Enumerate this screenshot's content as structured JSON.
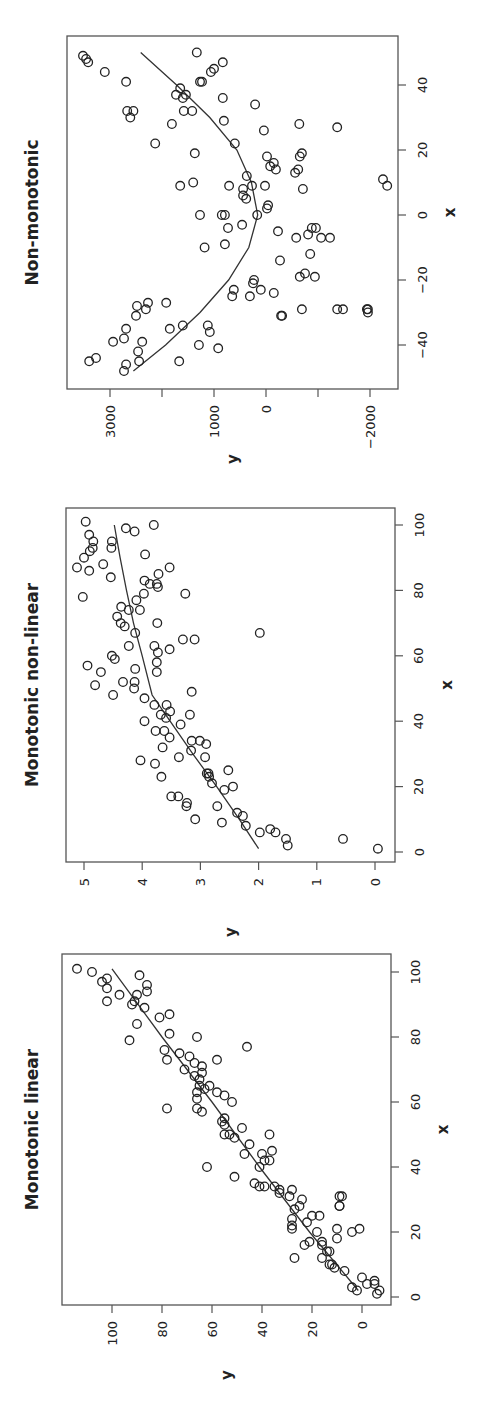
{
  "figure": {
    "orientation": "rotated-90-ccw",
    "panel_count": 3
  },
  "chart_data": [
    {
      "type": "scatter",
      "title": "Non-monotonic",
      "xlabel": "x",
      "ylabel": "y",
      "xlim": [
        -50,
        50
      ],
      "ylim": [
        -2600,
        3700
      ],
      "xticks": [
        -40,
        -20,
        0,
        20,
        40
      ],
      "yticks": [
        -2000,
        -1000,
        0,
        1000,
        2000,
        3000
      ],
      "ytick_labels": [
        "-2000",
        "",
        "0",
        "1000",
        "",
        "3000"
      ],
      "grid": false,
      "layout": {
        "box": [
          67,
          36,
          398,
          389
        ],
        "x_zero_screen": 215,
        "x_px_per_unit": 3.25,
        "y_zero_screen": 266,
        "y_px_per_unit": 0.052
      },
      "points": [
        [
          49,
          3520
        ],
        [
          47,
          3420
        ],
        [
          48,
          3460
        ],
        [
          41,
          2690
        ],
        [
          44,
          3100
        ],
        [
          32,
          2670
        ],
        [
          32,
          2550
        ],
        [
          30,
          2610
        ],
        [
          28,
          1810
        ],
        [
          22,
          2130
        ],
        [
          9,
          1650
        ],
        [
          50,
          1330
        ],
        [
          47,
          830
        ],
        [
          44,
          1060
        ],
        [
          45,
          1000
        ],
        [
          41,
          1270
        ],
        [
          37,
          1540
        ],
        [
          32,
          1580
        ],
        [
          36,
          830
        ],
        [
          29,
          810
        ],
        [
          32,
          1420
        ],
        [
          19,
          1370
        ],
        [
          10,
          1400
        ],
        [
          36,
          1600
        ],
        [
          37,
          1730
        ],
        [
          41,
          1230
        ],
        [
          39,
          1650
        ],
        [
          22,
          600
        ],
        [
          34,
          210
        ],
        [
          26,
          40
        ],
        [
          9,
          270
        ],
        [
          18,
          -20
        ],
        [
          9,
          20
        ],
        [
          16,
          -150
        ],
        [
          3,
          -40
        ],
        [
          2,
          -20
        ],
        [
          12,
          370
        ],
        [
          6,
          440
        ],
        [
          8,
          440
        ],
        [
          -4,
          730
        ],
        [
          -3,
          460
        ],
        [
          5,
          380
        ],
        [
          9,
          710
        ],
        [
          0,
          850
        ],
        [
          -10,
          1180
        ],
        [
          -9,
          790
        ],
        [
          0,
          1270
        ],
        [
          0,
          790
        ],
        [
          0,
          170
        ],
        [
          28,
          -640
        ],
        [
          19,
          -690
        ],
        [
          18,
          -650
        ],
        [
          14,
          -620
        ],
        [
          15,
          -80
        ],
        [
          14,
          -190
        ],
        [
          8,
          -710
        ],
        [
          13,
          -560
        ],
        [
          -4,
          -880
        ],
        [
          -6,
          -810
        ],
        [
          -7,
          -580
        ],
        [
          -5,
          -230
        ],
        [
          -4,
          -960
        ],
        [
          -7,
          -1060
        ],
        [
          -7,
          -1230
        ],
        [
          -12,
          -850
        ],
        [
          -14,
          -270
        ],
        [
          -20,
          230
        ],
        [
          -25,
          310
        ],
        [
          -23,
          620
        ],
        [
          -25,
          650
        ],
        [
          -21,
          250
        ],
        [
          -23,
          100
        ],
        [
          -24,
          -150
        ],
        [
          -31,
          -310
        ],
        [
          -18,
          -750
        ],
        [
          -19,
          -650
        ],
        [
          -19,
          -940
        ],
        [
          -29,
          -690
        ],
        [
          -29,
          -1370
        ],
        [
          -30,
          -1960
        ],
        [
          -29,
          -1480
        ],
        [
          9,
          -2330
        ],
        [
          11,
          -2250
        ],
        [
          27,
          -1370
        ],
        [
          -29,
          -1940
        ],
        [
          -29,
          -1960
        ],
        [
          -27,
          1920
        ],
        [
          -34,
          1600
        ],
        [
          -36,
          1080
        ],
        [
          -40,
          1290
        ],
        [
          -34,
          1120
        ],
        [
          -27,
          2270
        ],
        [
          -31,
          2500
        ],
        [
          -28,
          2480
        ],
        [
          -29,
          2310
        ],
        [
          -35,
          2690
        ],
        [
          -38,
          2730
        ],
        [
          -39,
          2940
        ],
        [
          -44,
          3270
        ],
        [
          -45,
          3400
        ],
        [
          -46,
          2690
        ],
        [
          -48,
          2730
        ],
        [
          -42,
          2460
        ],
        [
          -39,
          2380
        ],
        [
          -45,
          2440
        ],
        [
          -45,
          1670
        ],
        [
          -35,
          1850
        ],
        [
          -41,
          920
        ],
        [
          -31,
          -290
        ]
      ],
      "fit_curve": [
        [
          -48,
          2550
        ],
        [
          -40,
          1930
        ],
        [
          -30,
          1270
        ],
        [
          -20,
          720
        ],
        [
          -10,
          330
        ],
        [
          0,
          160
        ],
        [
          10,
          280
        ],
        [
          20,
          560
        ],
        [
          30,
          1080
        ],
        [
          40,
          1720
        ],
        [
          50,
          2410
        ]
      ]
    },
    {
      "type": "scatter",
      "title": "Monotonic non-linear",
      "xlabel": "x",
      "ylabel": "y",
      "xlim": [
        -4,
        104
      ],
      "ylim": [
        -0.2,
        5.3
      ],
      "xticks": [
        0,
        20,
        40,
        60,
        80,
        100
      ],
      "yticks": [
        0,
        1,
        2,
        3,
        4,
        5
      ],
      "grid": false,
      "layout": {
        "box": [
          66,
          508,
          395,
          862
        ],
        "x_zero_screen": 852,
        "x_px_per_unit": 3.27,
        "y_zero_screen": 375,
        "y_px_per_unit": 58.2
      },
      "points": [
        [
          101,
          4.97
        ],
        [
          97,
          4.91
        ],
        [
          95,
          4.84
        ],
        [
          93,
          4.85
        ],
        [
          92,
          4.9
        ],
        [
          90,
          5.0
        ],
        [
          87,
          5.12
        ],
        [
          86,
          4.91
        ],
        [
          88,
          4.67
        ],
        [
          95,
          4.52
        ],
        [
          93,
          4.53
        ],
        [
          84,
          4.54
        ],
        [
          78,
          5.02
        ],
        [
          99,
          4.28
        ],
        [
          98,
          4.13
        ],
        [
          100,
          3.8
        ],
        [
          91,
          3.95
        ],
        [
          87,
          3.53
        ],
        [
          85,
          3.72
        ],
        [
          83,
          3.96
        ],
        [
          82,
          3.87
        ],
        [
          81,
          3.73
        ],
        [
          82,
          3.75
        ],
        [
          79,
          3.97
        ],
        [
          79,
          3.26
        ],
        [
          77,
          4.1
        ],
        [
          75,
          4.36
        ],
        [
          74,
          4.23
        ],
        [
          74,
          4.04
        ],
        [
          72,
          4.43
        ],
        [
          70,
          4.37
        ],
        [
          69,
          4.3
        ],
        [
          70,
          3.74
        ],
        [
          67,
          4.12
        ],
        [
          67,
          1.98
        ],
        [
          65,
          3.3
        ],
        [
          65,
          3.1
        ],
        [
          63,
          4.23
        ],
        [
          63,
          3.79
        ],
        [
          61,
          3.73
        ],
        [
          62,
          3.53
        ],
        [
          60,
          4.52
        ],
        [
          59,
          4.47
        ],
        [
          58,
          3.75
        ],
        [
          57,
          4.94
        ],
        [
          55,
          4.71
        ],
        [
          55,
          3.75
        ],
        [
          56,
          4.12
        ],
        [
          52,
          4.13
        ],
        [
          51,
          4.81
        ],
        [
          50,
          4.14
        ],
        [
          52,
          4.33
        ],
        [
          48,
          4.5
        ],
        [
          49,
          3.15
        ],
        [
          47,
          3.96
        ],
        [
          45,
          3.79
        ],
        [
          45,
          3.58
        ],
        [
          43,
          3.52
        ],
        [
          42,
          3.68
        ],
        [
          41,
          3.59
        ],
        [
          42,
          3.18
        ],
        [
          40,
          3.96
        ],
        [
          39,
          3.34
        ],
        [
          37,
          3.77
        ],
        [
          37,
          3.62
        ],
        [
          35,
          3.53
        ],
        [
          34,
          3.01
        ],
        [
          34,
          3.15
        ],
        [
          33,
          2.9
        ],
        [
          32,
          3.65
        ],
        [
          31,
          3.16
        ],
        [
          29,
          3.37
        ],
        [
          29,
          2.92
        ],
        [
          28,
          4.03
        ],
        [
          27,
          3.78
        ],
        [
          25,
          2.52
        ],
        [
          24,
          2.89
        ],
        [
          24,
          2.86
        ],
        [
          23,
          3.67
        ],
        [
          23,
          2.85
        ],
        [
          21,
          2.8
        ],
        [
          20,
          2.44
        ],
        [
          19,
          2.59
        ],
        [
          17,
          3.5
        ],
        [
          17,
          3.38
        ],
        [
          15,
          3.23
        ],
        [
          14,
          2.71
        ],
        [
          14,
          3.24
        ],
        [
          12,
          2.37
        ],
        [
          11,
          2.27
        ],
        [
          10,
          3.09
        ],
        [
          9,
          2.63
        ],
        [
          8,
          2.22
        ],
        [
          7,
          1.8
        ],
        [
          6,
          1.98
        ],
        [
          6,
          1.71
        ],
        [
          4,
          1.53
        ],
        [
          2,
          1.5
        ],
        [
          4,
          0.55
        ],
        [
          1,
          -0.05
        ]
      ],
      "fit_curve": [
        [
          1,
          2.0
        ],
        [
          10,
          2.33
        ],
        [
          20,
          2.72
        ],
        [
          30,
          3.13
        ],
        [
          40,
          3.52
        ],
        [
          48,
          3.83
        ],
        [
          60,
          4.0
        ],
        [
          70,
          4.15
        ],
        [
          80,
          4.27
        ],
        [
          90,
          4.38
        ],
        [
          100,
          4.48
        ]
      ]
    },
    {
      "type": "scatter",
      "title": "Monotonic linear",
      "xlabel": "x",
      "ylabel": "y",
      "xlim": [
        -4,
        104
      ],
      "ylim": [
        -8,
        118
      ],
      "xticks": [
        0,
        20,
        40,
        60,
        80,
        100
      ],
      "yticks": [
        0,
        20,
        40,
        60,
        80,
        100
      ],
      "grid": false,
      "layout": {
        "box": [
          62,
          954,
          391,
          1305
        ],
        "x_zero_screen": 1297,
        "x_px_per_unit": 3.25,
        "y_zero_screen": 362,
        "y_px_per_unit": 2.5
      },
      "points": [
        [
          101,
          114
        ],
        [
          100,
          108
        ],
        [
          97,
          104
        ],
        [
          98,
          102
        ],
        [
          95,
          102
        ],
        [
          91,
          102
        ],
        [
          93,
          90
        ],
        [
          99,
          89
        ],
        [
          96,
          86
        ],
        [
          94,
          86
        ],
        [
          93,
          97
        ],
        [
          91,
          91
        ],
        [
          90,
          92
        ],
        [
          89,
          87
        ],
        [
          86,
          81
        ],
        [
          84,
          90
        ],
        [
          87,
          77
        ],
        [
          80,
          66
        ],
        [
          81,
          77
        ],
        [
          79,
          93
        ],
        [
          77,
          46
        ],
        [
          76,
          79
        ],
        [
          73,
          78
        ],
        [
          75,
          73
        ],
        [
          74,
          69
        ],
        [
          72,
          67
        ],
        [
          73,
          58
        ],
        [
          71,
          64
        ],
        [
          69,
          64
        ],
        [
          70,
          71
        ],
        [
          68,
          67
        ],
        [
          67,
          65
        ],
        [
          65,
          65
        ],
        [
          65,
          61
        ],
        [
          63,
          66
        ],
        [
          61,
          66
        ],
        [
          58,
          78
        ],
        [
          58,
          66
        ],
        [
          57,
          64
        ],
        [
          64,
          63
        ],
        [
          63,
          58
        ],
        [
          62,
          55
        ],
        [
          60,
          52
        ],
        [
          55,
          55
        ],
        [
          54,
          56
        ],
        [
          53,
          55
        ],
        [
          50,
          55
        ],
        [
          50,
          53
        ],
        [
          49,
          51
        ],
        [
          52,
          48
        ],
        [
          50,
          37
        ],
        [
          47,
          45
        ],
        [
          44,
          47
        ],
        [
          44,
          40
        ],
        [
          45,
          36
        ],
        [
          42,
          39
        ],
        [
          42,
          37
        ],
        [
          40,
          62
        ],
        [
          40,
          41
        ],
        [
          37,
          51
        ],
        [
          35,
          43
        ],
        [
          34,
          41
        ],
        [
          34,
          39
        ],
        [
          34,
          35
        ],
        [
          32,
          33
        ],
        [
          33,
          33
        ],
        [
          33,
          28
        ],
        [
          31,
          29
        ],
        [
          30,
          24
        ],
        [
          28,
          25
        ],
        [
          27,
          27
        ],
        [
          25,
          20
        ],
        [
          24,
          28
        ],
        [
          25,
          17
        ],
        [
          23,
          22
        ],
        [
          22,
          28
        ],
        [
          21,
          28
        ],
        [
          21,
          10
        ],
        [
          20,
          18
        ],
        [
          17,
          21
        ],
        [
          17,
          16
        ],
        [
          16,
          23
        ],
        [
          16,
          16
        ],
        [
          14,
          14
        ],
        [
          14,
          13
        ],
        [
          12,
          16
        ],
        [
          10,
          12
        ],
        [
          10,
          13
        ],
        [
          9,
          11
        ],
        [
          8,
          7
        ],
        [
          6,
          0
        ],
        [
          4,
          -2
        ],
        [
          3,
          4
        ],
        [
          2,
          2
        ],
        [
          4,
          -5
        ],
        [
          2,
          -7
        ],
        [
          1,
          -6
        ],
        [
          5,
          -5
        ],
        [
          21,
          1
        ],
        [
          20,
          4
        ],
        [
          28,
          9
        ],
        [
          31,
          8
        ],
        [
          31,
          9
        ],
        [
          18,
          10
        ],
        [
          12,
          27
        ],
        [
          28,
          9
        ]
      ],
      "fit_curve": [
        [
          2,
          1.5
        ],
        [
          20,
          21
        ],
        [
          40,
          41
        ],
        [
          60,
          60
        ],
        [
          80,
          80
        ],
        [
          101,
          100
        ]
      ]
    }
  ]
}
